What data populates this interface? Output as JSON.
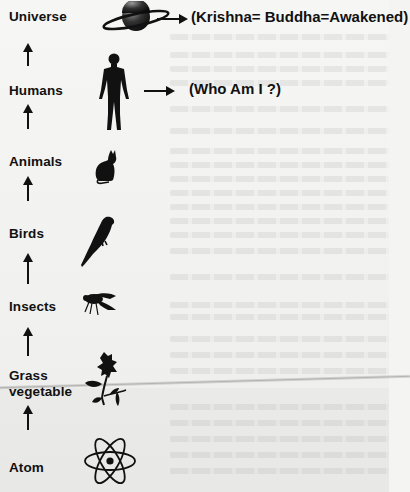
{
  "diagram": {
    "type": "evolution-hierarchy",
    "levels": [
      {
        "label": "Universe",
        "icon": "planet-icon",
        "note": "(Krishna= Buddha=Awakened)"
      },
      {
        "label": "Humans",
        "icon": "human-figure-icon",
        "note": "(Who Am I ?)"
      },
      {
        "label": "Animals",
        "icon": "cat-icon"
      },
      {
        "label": "Birds",
        "icon": "parrot-icon"
      },
      {
        "label": "Insects",
        "icon": "fly-icon"
      },
      {
        "label": "Grass",
        "label_line2": "vegetable",
        "icon": "flower-plant-icon"
      },
      {
        "label": "Atom",
        "icon": "atom-icon"
      }
    ],
    "flow_direction": "bottom-to-top",
    "colors": {
      "ink": "#111111",
      "paper": "#f4f4f2"
    }
  }
}
